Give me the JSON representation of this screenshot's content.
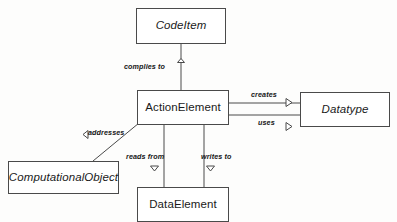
{
  "diagram": {
    "type": "uml-class-diagram",
    "background_color": "#fdfdfc",
    "line_color": "#4a4a4a",
    "text_color": "#1a1a1a",
    "nodes": [
      {
        "id": "codeitem",
        "label": "CodeItem",
        "abstract": true
      },
      {
        "id": "actionelement",
        "label": "ActionElement",
        "abstract": false
      },
      {
        "id": "datatype",
        "label": "Datatype",
        "abstract": true
      },
      {
        "id": "computationalobject",
        "label": "ComputationalObject",
        "abstract": true
      },
      {
        "id": "dataelement",
        "label": "DataElement",
        "abstract": false
      }
    ],
    "edges": [
      {
        "id": "complies-to",
        "label": "complies to",
        "from": "actionelement",
        "to": "codeitem",
        "marker": "triangle-up"
      },
      {
        "id": "creates",
        "label": "creates",
        "from": "actionelement",
        "to": "datatype",
        "marker": "triangle-right"
      },
      {
        "id": "uses",
        "label": "uses",
        "from": "actionelement",
        "to": "datatype",
        "marker": "triangle-right"
      },
      {
        "id": "addresses",
        "label": "addresses",
        "from": "actionelement",
        "to": "computationalobject",
        "marker": "triangle-left"
      },
      {
        "id": "reads-from",
        "label": "reads from",
        "from": "actionelement",
        "to": "dataelement",
        "marker": "triangle-down"
      },
      {
        "id": "writes-to",
        "label": "writes to",
        "from": "actionelement",
        "to": "dataelement",
        "marker": "triangle-down"
      }
    ]
  }
}
